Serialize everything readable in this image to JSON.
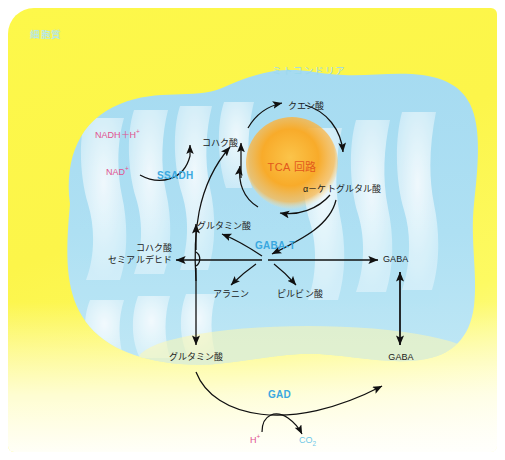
{
  "diagram": {
    "compartments": {
      "cytoplasm_label": "細胞質",
      "mitochondria_label": "ミトコンドリア"
    },
    "colors": {
      "cytoplasm": "#fdf84a",
      "mitochondria": "#a8dcf0",
      "tca_circle": "#f5a623",
      "enzyme_text": "#3aa8e0",
      "cofactor_text": "#e0528f",
      "tca_text": "#e2581c",
      "arrow": "#101010"
    },
    "tca": {
      "center_label": "TCA 回路",
      "citrate": "クエン酸",
      "succinate": "コハク酸",
      "alpha_ketoglutarate": "α－ケトグルタル酸"
    },
    "enzymes": {
      "ssadh": "SSADH",
      "gaba_t": "GABA-T",
      "gad": "GAD"
    },
    "cofactors": {
      "nadh_h": "NADH＋H",
      "nadh_h_sup": "+",
      "nad": "NAD",
      "nad_sup": "+",
      "proton": "H",
      "proton_sup": "+",
      "co2": "CO",
      "co2_sub": "2"
    },
    "metabolites": {
      "succinic_semialdehyde_line1": "コハク酸",
      "succinic_semialdehyde_line2": "セミアルデヒド",
      "glutamate_mito": "グルタミン酸",
      "alanine": "アラニン",
      "pyruvate": "ピルビン酸",
      "gaba_mito": "GABA",
      "glutamate_cyto": "グルタミン酸",
      "gaba_cyto": "GABA"
    }
  }
}
